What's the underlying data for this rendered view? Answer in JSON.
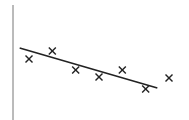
{
  "chart_data": {
    "type": "scatter",
    "title": "",
    "xlabel": "",
    "ylabel": "",
    "grid": false,
    "legend": null,
    "marker": "x",
    "points": [
      {
        "x": 1,
        "y": 6.1
      },
      {
        "x": 2,
        "y": 6.9
      },
      {
        "x": 3,
        "y": 5.0
      },
      {
        "x": 4,
        "y": 4.3
      },
      {
        "x": 5,
        "y": 5.0
      },
      {
        "x": 6,
        "y": 3.1
      },
      {
        "x": 7,
        "y": 4.2
      }
    ],
    "trend_line": {
      "x_start": 0.6,
      "y_start": 7.2,
      "x_end": 6.5,
      "y_end": 3.2
    },
    "colors": {
      "marker": "#222222",
      "line": "#222222",
      "axis": "#777777"
    }
  }
}
